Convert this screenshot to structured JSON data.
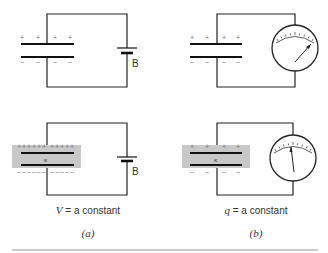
{
  "figure": {
    "panels": [
      {
        "id": "a",
        "label": "(a)",
        "condition_var": "V",
        "condition_text": " = a constant",
        "source_label": "B",
        "source": "battery"
      },
      {
        "id": "b",
        "label": "(b)",
        "condition_var": "q",
        "condition_text": " = a constant",
        "source": "electrometer"
      }
    ],
    "dielectric_symbol": "κ",
    "colors": {
      "wire": "#222222",
      "plate": "#111111",
      "dielectric": "#c8c8c8",
      "sign": "#777777",
      "rule": "#999999"
    }
  }
}
